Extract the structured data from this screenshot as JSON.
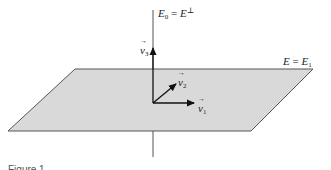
{
  "diagram": {
    "type": "geometric-vector-diagram",
    "plane": {
      "label_lhs": "E",
      "label_eq": " = ",
      "label_rhs": "E",
      "label_rhs_sub": "1",
      "fill": "#d9d9d9",
      "stroke": "#555555"
    },
    "axis": {
      "label_lhs": "E",
      "label_lhs_sub": "0",
      "label_eq": " = ",
      "label_rhs": "E",
      "label_rhs_sup": "⊥",
      "stroke": "#555555"
    },
    "vectors": [
      {
        "name": "v",
        "sub": "1",
        "direction": "right"
      },
      {
        "name": "v",
        "sub": "2",
        "direction": "diagonal"
      },
      {
        "name": "v",
        "sub": "3",
        "direction": "up"
      }
    ],
    "caption": "Figure 1"
  }
}
